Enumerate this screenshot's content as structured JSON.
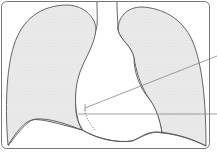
{
  "diagram": {
    "colors": {
      "background": "#ffffff",
      "lung_fill": "#e6e6e6",
      "outline": "#555555",
      "frame": "#777777",
      "leader_line": "#888888"
    },
    "parts": [
      {
        "id": "right-lung",
        "label": ""
      },
      {
        "id": "left-lung",
        "label": ""
      },
      {
        "id": "heart-silhouette",
        "label": ""
      },
      {
        "id": "trachea",
        "label": ""
      },
      {
        "id": "diaphragm",
        "label": ""
      }
    ],
    "leader_lines": [
      {
        "id": "pointer-1",
        "label": ""
      },
      {
        "id": "pointer-2",
        "label": ""
      }
    ]
  }
}
